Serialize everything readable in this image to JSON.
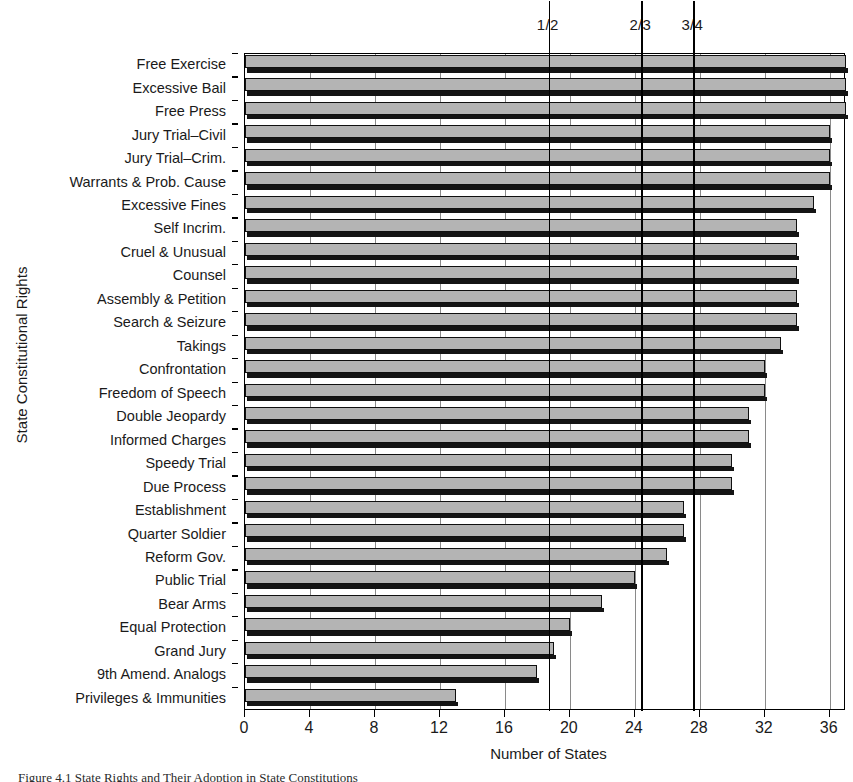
{
  "chart_data": {
    "type": "bar",
    "orientation": "horizontal",
    "title": "",
    "xlabel": "Number of States",
    "ylabel": "State Constitutional Rights",
    "xlim": [
      0,
      37
    ],
    "ylim": [
      0,
      28
    ],
    "grid": true,
    "legend": null,
    "xticks": [
      0,
      4,
      8,
      12,
      16,
      20,
      24,
      28,
      32,
      36
    ],
    "xticklabels": [
      "0",
      "4",
      "8",
      "12",
      "16",
      "20",
      "24",
      "28",
      "32",
      "36"
    ],
    "categories": [
      "Free Exercise",
      "Excessive Bail",
      "Free Press",
      "Jury Trial–Civil",
      "Jury Trial–Crim.",
      "Warrants & Prob. Cause",
      "Excessive Fines",
      "Self Incrim.",
      "Cruel & Unusual",
      "Counsel",
      "Assembly & Petition",
      "Search & Seizure",
      "Takings",
      "Confrontation",
      "Freedom of Speech",
      "Double Jeopardy",
      "Informed Charges",
      "Speedy Trial",
      "Due Process",
      "Establishment",
      "Quarter Soldier",
      "Reform Gov.",
      "Public Trial",
      "Bear Arms",
      "Equal Protection",
      "Grand Jury",
      "9th Amend. Analogs",
      "Privileges & Immunities"
    ],
    "values": [
      37,
      37,
      37,
      36,
      36,
      36,
      35,
      34,
      34,
      34,
      34,
      34,
      33,
      32,
      32,
      31,
      31,
      30,
      30,
      27,
      27,
      26,
      24,
      22,
      20,
      19,
      18,
      13
    ],
    "annotations": [
      {
        "label": "1/2",
        "value": 18.7
      },
      {
        "label": "2/3",
        "value": 24.4
      },
      {
        "label": "3/4",
        "value": 27.6
      }
    ]
  },
  "caption": {
    "figure_number": "Figure 4.1",
    "text": "Figure 4.1  State Rights and Their Adoption in State Constitutions"
  }
}
